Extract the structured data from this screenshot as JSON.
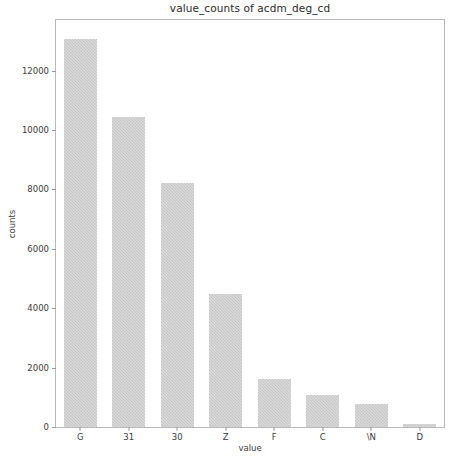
{
  "chart_data": {
    "type": "bar",
    "title": "value_counts of acdm_deg_cd",
    "xlabel": "value",
    "ylabel": "counts",
    "categories": [
      "G",
      "31",
      "30",
      "Z",
      "F",
      "C",
      "\\N",
      "D"
    ],
    "values": [
      13050,
      10450,
      8230,
      4480,
      1630,
      1090,
      790,
      110
    ],
    "ylim": [
      0,
      13700
    ],
    "yticks": [
      0,
      2000,
      4000,
      6000,
      8000,
      10000,
      12000
    ],
    "ytick_labels": [
      "0",
      "2000",
      "4000",
      "6000",
      "8000",
      "10000",
      "12000"
    ],
    "grid": false,
    "legend": null,
    "bar_color": "#c9c9c9",
    "axes_color": "#b9b9b9",
    "background": "#ffffff"
  }
}
